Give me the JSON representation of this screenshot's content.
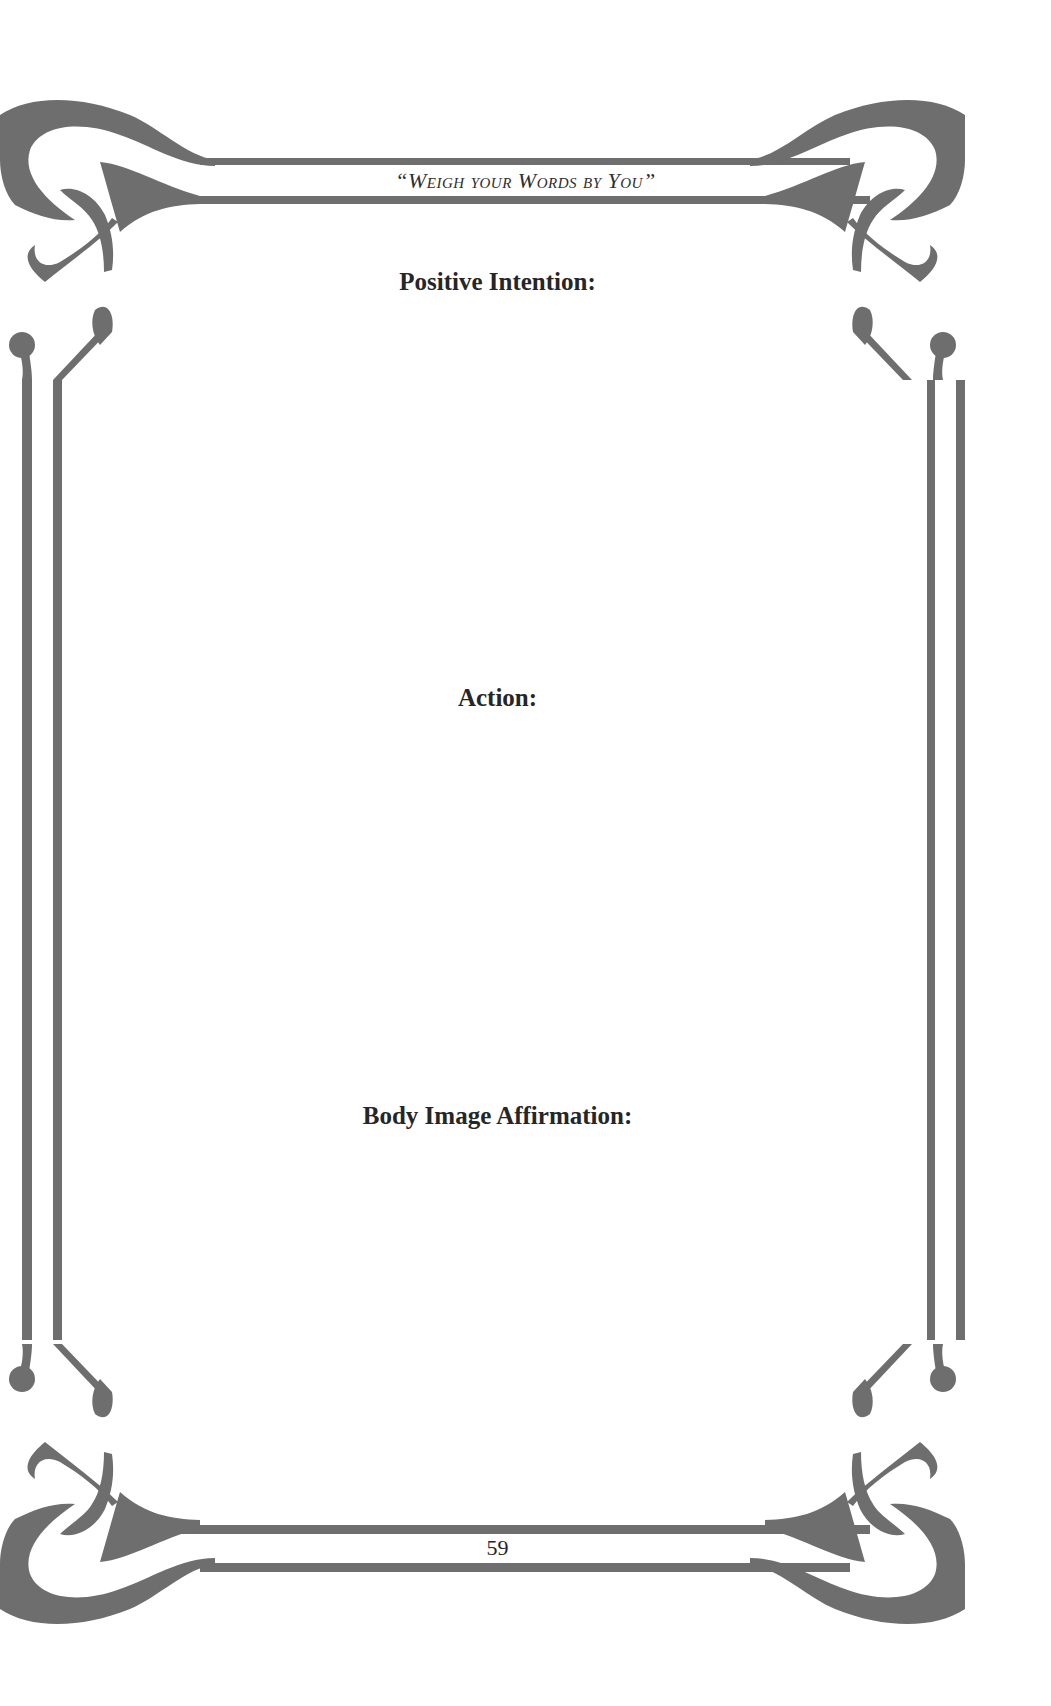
{
  "page": {
    "running_header": "“Weigh your Words by You”",
    "sections": [
      {
        "label": "Positive Intention:"
      },
      {
        "label": "Action:"
      },
      {
        "label": "Body Image Affirmation:"
      }
    ],
    "page_number": "59"
  },
  "style": {
    "frame_color": "#6e6e6e",
    "text_color": "#262626",
    "background": "#ffffff"
  },
  "decorations": {
    "frame": "art-nouveau-ornamental-border-icon"
  }
}
